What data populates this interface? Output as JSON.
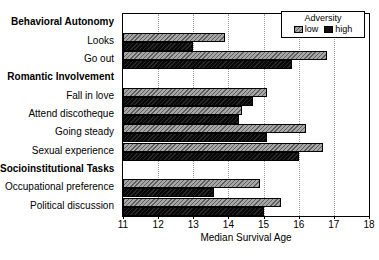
{
  "chart_data": {
    "type": "bar",
    "orientation": "horizontal",
    "title": "",
    "xlabel": "Median Survival Age",
    "ylabel": "",
    "xlim": [
      11,
      18
    ],
    "xticks": [
      11,
      12,
      13,
      14,
      15,
      16,
      17,
      18
    ],
    "grid": true,
    "grid_axis": "x",
    "legend": {
      "title": "Adversity",
      "position": "top-right",
      "entries": [
        {
          "name": "low",
          "color": "#808080",
          "pattern": "diagonal-hatch"
        },
        {
          "name": "high",
          "color": "#111111",
          "pattern": "solid"
        }
      ]
    },
    "categories": [
      "Behavioral Autonomy",
      "Looks",
      "Go out",
      "Romantic Involvement",
      "Fall in love",
      "Attend discotheque",
      "Going steady",
      "Sexual experience",
      "Socioinstitutional Tasks",
      "Occupational preference",
      "Political discussion"
    ],
    "category_is_header": [
      true,
      false,
      false,
      true,
      false,
      false,
      false,
      false,
      true,
      false,
      false
    ],
    "series": [
      {
        "name": "low",
        "values": [
          null,
          13.9,
          16.8,
          null,
          15.1,
          14.4,
          16.2,
          16.7,
          null,
          14.9,
          15.5
        ]
      },
      {
        "name": "high",
        "values": [
          null,
          13.0,
          15.8,
          null,
          14.7,
          14.3,
          15.1,
          16.0,
          null,
          13.6,
          15.0
        ]
      }
    ]
  },
  "axis": {
    "x_title": "Median Survival Age",
    "tick_labels": [
      "11",
      "12",
      "13",
      "14",
      "15",
      "16",
      "17",
      "18"
    ]
  },
  "legend": {
    "title": "Adversity",
    "low_label": "low",
    "high_label": "high"
  }
}
